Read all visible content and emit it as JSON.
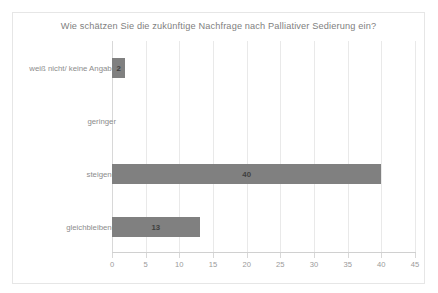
{
  "chart_data": {
    "type": "bar",
    "orientation": "horizontal",
    "title": "Wie schätzen Sie die zukünftige Nachfrage nach Palliativer Sedierung ein?",
    "categories": [
      "weiß nicht/ keine Angabe",
      "geringer",
      "steigend",
      "gleichbleibend"
    ],
    "values": [
      2,
      0,
      40,
      13
    ],
    "data_labels": [
      "2",
      "",
      "40",
      "13"
    ],
    "xlabel": "",
    "ylabel": "",
    "xlim": [
      0,
      45
    ],
    "xticks": [
      0,
      5,
      10,
      15,
      20,
      25,
      30,
      35,
      40,
      45
    ],
    "xtick_labels": [
      "0",
      "5",
      "10",
      "15",
      "20",
      "25",
      "30",
      "35",
      "40",
      "45"
    ],
    "grid": "vertical",
    "legend": "none",
    "colors": {
      "bar": "#808080",
      "gridline": "#e9e9e9",
      "axis": "#d0d0d0",
      "title_text": "#808080",
      "tick_text": "#9a9a9a",
      "category_text": "#8c8c8c",
      "value_text": "#3f3f3f",
      "border": "#e6e6e6",
      "background": "#ffffff"
    }
  }
}
